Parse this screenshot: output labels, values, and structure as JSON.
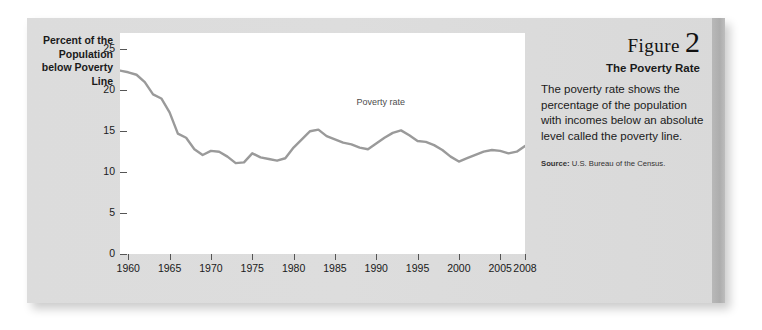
{
  "figure": {
    "word": "Figure",
    "number": "2",
    "subtitle": "The Poverty Rate",
    "body": "The poverty rate shows the percentage of the population with incomes below an absolute level called the poverty line.",
    "source_label": "Source:",
    "source_text": "U.S. Bureau of the Census."
  },
  "colors": {
    "card_background": "#dcdcdc",
    "plot_background": "#ffffff",
    "line": "#9a9a9a",
    "axis": "#555555",
    "text": "#1a1a1a",
    "right_band": "#b2b2b2"
  },
  "chart_data": {
    "type": "line",
    "title": "",
    "ylabel": "Percent of the Population below Poverty Line",
    "xlabel": "",
    "xlim": [
      1959,
      2008
    ],
    "ylim": [
      0,
      27
    ],
    "grid": false,
    "legend": "none",
    "yticks": [
      0,
      5,
      10,
      15,
      20,
      25
    ],
    "ytick_labels": [
      "0",
      "5",
      "10",
      "15",
      "20",
      "25"
    ],
    "xticks": [
      1960,
      1965,
      1970,
      1975,
      1980,
      1985,
      1990,
      1995,
      2000,
      2005,
      2008
    ],
    "xtick_labels": [
      "1960",
      "1965",
      "1970",
      "1975",
      "1980",
      "1985",
      "1990",
      "1995",
      "2000",
      "2005",
      "2008"
    ],
    "annotations": [
      {
        "text": "Poverty rate",
        "x": 1991,
        "y": 18.5
      }
    ],
    "series": [
      {
        "name": "Poverty rate",
        "color": "#9a9a9a",
        "x": [
          1959,
          1960,
          1961,
          1962,
          1963,
          1964,
          1965,
          1966,
          1967,
          1968,
          1969,
          1970,
          1971,
          1972,
          1973,
          1974,
          1975,
          1976,
          1977,
          1978,
          1979,
          1980,
          1981,
          1982,
          1983,
          1984,
          1985,
          1986,
          1987,
          1988,
          1989,
          1990,
          1991,
          1992,
          1993,
          1994,
          1995,
          1996,
          1997,
          1998,
          1999,
          2000,
          2001,
          2002,
          2003,
          2004,
          2005,
          2006,
          2007,
          2008
        ],
        "values": [
          22.4,
          22.2,
          21.9,
          21.0,
          19.5,
          19.0,
          17.3,
          14.7,
          14.2,
          12.8,
          12.1,
          12.6,
          12.5,
          11.9,
          11.1,
          11.2,
          12.3,
          11.8,
          11.6,
          11.4,
          11.7,
          13.0,
          14.0,
          15.0,
          15.2,
          14.4,
          14.0,
          13.6,
          13.4,
          13.0,
          12.8,
          13.5,
          14.2,
          14.8,
          15.1,
          14.5,
          13.8,
          13.7,
          13.3,
          12.7,
          11.9,
          11.3,
          11.7,
          12.1,
          12.5,
          12.7,
          12.6,
          12.3,
          12.5,
          13.2
        ]
      }
    ]
  }
}
